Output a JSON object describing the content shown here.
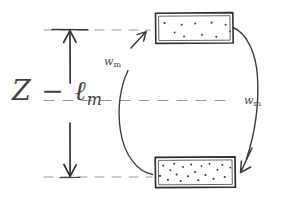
{
  "diagram": {
    "type": "hand-drawn-schematic",
    "background_color": "#ffffff",
    "ink_color": "#3a3a3c",
    "dash_color": "#8e8e90",
    "labels": {
      "height_symbol": "Z − ℓ",
      "height_subscript": "m",
      "flux_left_symbol": "w",
      "flux_left_subscript": "m",
      "flux_right_symbol": "w",
      "flux_right_subscript": "m"
    },
    "dimension_arrow": {
      "name": "Z-minus-ell-m",
      "orientation": "vertical",
      "double_headed": true,
      "shaft_x": 70,
      "top_y": 30,
      "bottom_y": 177
    },
    "dashed_lines": [
      {
        "name": "top-reference-line",
        "y": 30,
        "x1": 44,
        "x2": 150
      },
      {
        "name": "middle-reference-line",
        "y": 100,
        "x1": 44,
        "x2": 232
      },
      {
        "name": "bottom-reference-line",
        "y": 177,
        "x1": 44,
        "x2": 152
      }
    ],
    "boxes": [
      {
        "name": "upper-reservoir",
        "position": "top",
        "x": 155,
        "y": 13,
        "width": 78,
        "height": 30,
        "dot_count": 10,
        "density": "sparse",
        "dots": [
          [
            0.08,
            0.24
          ],
          [
            0.21,
            0.56
          ],
          [
            0.33,
            0.7
          ],
          [
            0.3,
            0.3
          ],
          [
            0.47,
            0.25
          ],
          [
            0.56,
            0.63
          ],
          [
            0.68,
            0.22
          ],
          [
            0.74,
            0.71
          ],
          [
            0.86,
            0.3
          ],
          [
            0.92,
            0.52
          ]
        ]
      },
      {
        "name": "lower-reservoir",
        "position": "bottom",
        "x": 155,
        "y": 157,
        "width": 80,
        "height": 30,
        "dot_count": 20,
        "density": "dense",
        "dots": [
          [
            0.06,
            0.62
          ],
          [
            0.1,
            0.28
          ],
          [
            0.16,
            0.74
          ],
          [
            0.19,
            0.44
          ],
          [
            0.24,
            0.22
          ],
          [
            0.27,
            0.58
          ],
          [
            0.32,
            0.78
          ],
          [
            0.35,
            0.33
          ],
          [
            0.41,
            0.63
          ],
          [
            0.45,
            0.25
          ],
          [
            0.5,
            0.5
          ],
          [
            0.54,
            0.76
          ],
          [
            0.58,
            0.3
          ],
          [
            0.63,
            0.6
          ],
          [
            0.68,
            0.22
          ],
          [
            0.72,
            0.72
          ],
          [
            0.77,
            0.42
          ],
          [
            0.83,
            0.26
          ],
          [
            0.86,
            0.66
          ],
          [
            0.93,
            0.35
          ]
        ]
      }
    ],
    "curved_arrows": [
      {
        "name": "upward-flux-arrow",
        "direction": "upward",
        "from": "lower-reservoir",
        "to": "upper-reservoir",
        "label": "w_m",
        "arrowhead_at": [
          140,
          38
        ]
      },
      {
        "name": "downward-flux-arrow",
        "direction": "downward",
        "from": "upper-reservoir",
        "to": "lower-reservoir",
        "label": "w_m",
        "arrowhead_at": [
          245,
          170
        ]
      }
    ]
  }
}
